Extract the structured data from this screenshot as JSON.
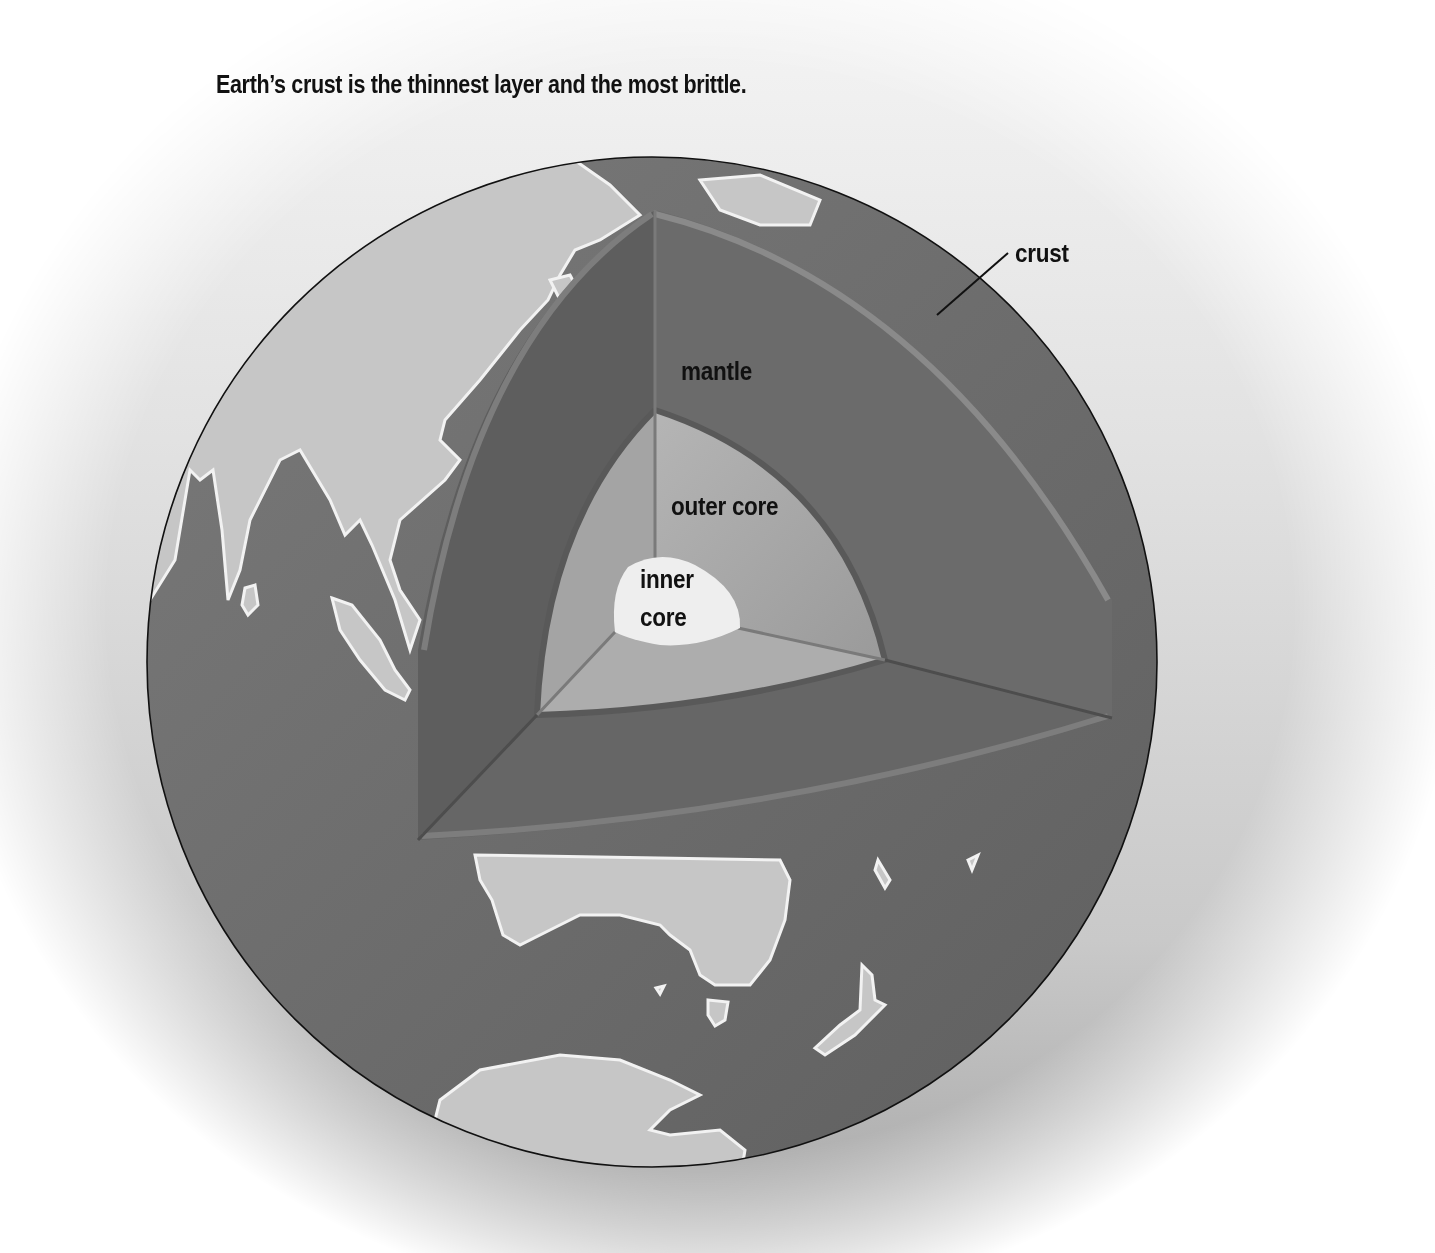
{
  "title": "Earth’s crust is the thinnest layer and the most brittle.",
  "labels": {
    "crust": "crust",
    "mantle": "mantle",
    "outer_core": "outer core",
    "inner_core_line1": "inner",
    "inner_core_line2": "core"
  },
  "colors": {
    "ocean": "#6f6f6f",
    "land": "#c6c6c6",
    "mantle": "#6a6a6a",
    "outer_core": "#a7a7a7",
    "inner_core": "#eeeeee",
    "text": "#111111"
  }
}
